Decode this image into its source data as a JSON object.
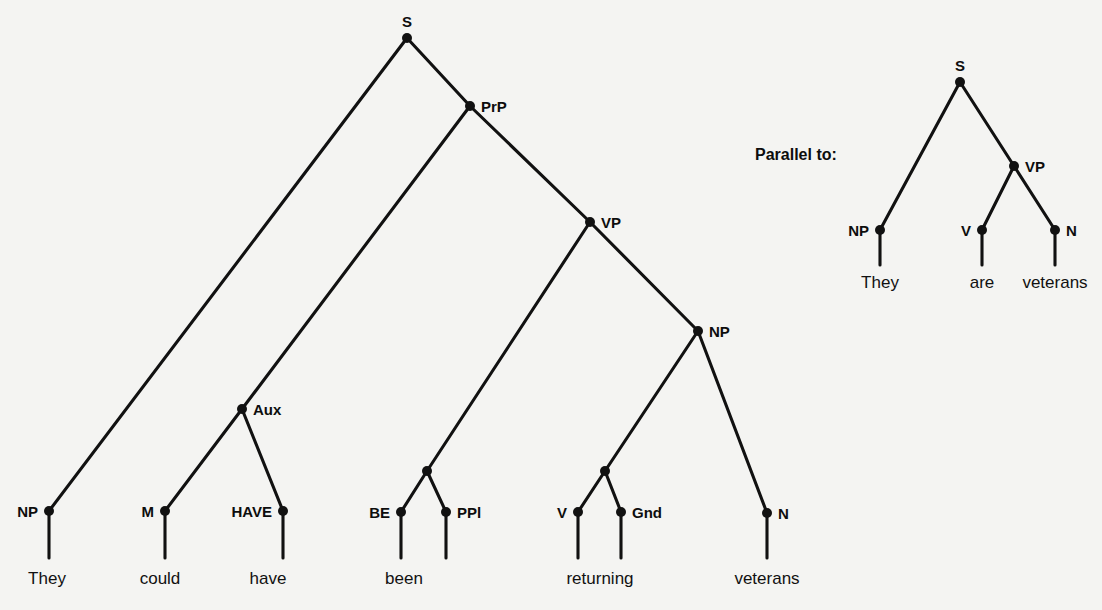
{
  "canvas": {
    "width": 1102,
    "height": 610,
    "background": "#f4f4f2",
    "ink": "#111111"
  },
  "annotation": {
    "parallel_caption": "Parallel to:"
  },
  "diagram": {
    "type": "syntax-tree",
    "sentence_main": "They could have been returning veterans",
    "sentence_parallel": "They are veterans"
  },
  "main_tree": {
    "name": "main-syntax-tree",
    "nodes": [
      {
        "id": "S",
        "label": "S",
        "x": 407,
        "y": 38,
        "anchor": "above"
      },
      {
        "id": "PrP",
        "label": "PrP",
        "x": 470,
        "y": 106,
        "anchor": "right"
      },
      {
        "id": "VP",
        "label": "VP",
        "x": 590,
        "y": 222,
        "anchor": "right"
      },
      {
        "id": "NPobj",
        "label": "NP",
        "x": 698,
        "y": 331,
        "anchor": "right"
      },
      {
        "id": "Aux",
        "label": "Aux",
        "x": 242,
        "y": 409,
        "anchor": "right"
      },
      {
        "id": "BEP",
        "label": "",
        "x": 427,
        "y": 471,
        "anchor": "none"
      },
      {
        "id": "VGP",
        "label": "",
        "x": 605,
        "y": 471,
        "anchor": "none"
      },
      {
        "id": "NPsub",
        "label": "NP",
        "x": 49,
        "y": 511,
        "anchor": "left"
      },
      {
        "id": "M",
        "label": "M",
        "x": 165,
        "y": 511,
        "anchor": "left"
      },
      {
        "id": "HAVE",
        "label": "HAVE",
        "x": 283,
        "y": 511,
        "anchor": "left"
      },
      {
        "id": "BE",
        "label": "BE",
        "x": 401,
        "y": 512,
        "anchor": "left"
      },
      {
        "id": "PPl",
        "label": "PPl",
        "x": 446,
        "y": 512,
        "anchor": "right"
      },
      {
        "id": "V",
        "label": "V",
        "x": 578,
        "y": 512,
        "anchor": "left"
      },
      {
        "id": "Gnd",
        "label": "Gnd",
        "x": 621,
        "y": 512,
        "anchor": "right"
      },
      {
        "id": "N",
        "label": "N",
        "x": 767,
        "y": 513,
        "anchor": "right"
      }
    ],
    "edges": [
      [
        "S",
        "NPsub"
      ],
      [
        "S",
        "PrP"
      ],
      [
        "PrP",
        "Aux"
      ],
      [
        "PrP",
        "VP"
      ],
      [
        "Aux",
        "M"
      ],
      [
        "Aux",
        "HAVE"
      ],
      [
        "VP",
        "BEP"
      ],
      [
        "VP",
        "NPobj"
      ],
      [
        "BEP",
        "BE"
      ],
      [
        "BEP",
        "PPl"
      ],
      [
        "NPobj",
        "VGP"
      ],
      [
        "NPobj",
        "N"
      ],
      [
        "VGP",
        "V"
      ],
      [
        "VGP",
        "Gnd"
      ]
    ],
    "terminals": [
      {
        "parent": "NPsub",
        "word": "They",
        "x": 47,
        "y": 583,
        "stem_top": 511,
        "stem_bottom": 558
      },
      {
        "parent": "M",
        "word": "could",
        "x": 160,
        "y": 583,
        "stem_top": 511,
        "stem_bottom": 558
      },
      {
        "parent": "HAVE",
        "word": "have",
        "x": 268,
        "y": 583,
        "stem_top": 511,
        "stem_bottom": 558
      },
      {
        "parent": "BE",
        "word": "been",
        "x": 404,
        "y": 583,
        "stem_top": 512,
        "stem_bottom": 558
      },
      {
        "parent": "PPl",
        "word": "",
        "x": 446,
        "y": 583,
        "stem_top": 512,
        "stem_bottom": 558
      },
      {
        "parent": "V",
        "word": "returning",
        "x": 600,
        "y": 583,
        "stem_top": 512,
        "stem_bottom": 558
      },
      {
        "parent": "Gnd",
        "word": "",
        "x": 621,
        "y": 583,
        "stem_top": 512,
        "stem_bottom": 558
      },
      {
        "parent": "N",
        "word": "veterans",
        "x": 767,
        "y": 583,
        "stem_top": 513,
        "stem_bottom": 558
      }
    ]
  },
  "parallel_tree": {
    "name": "parallel-syntax-tree",
    "nodes": [
      {
        "id": "S2",
        "label": "S",
        "x": 960,
        "y": 82,
        "anchor": "above"
      },
      {
        "id": "VP2",
        "label": "VP",
        "x": 1014,
        "y": 166,
        "anchor": "right"
      },
      {
        "id": "NP2",
        "label": "NP",
        "x": 880,
        "y": 230,
        "anchor": "left"
      },
      {
        "id": "V2",
        "label": "V",
        "x": 982,
        "y": 230,
        "anchor": "left"
      },
      {
        "id": "N2",
        "label": "N",
        "x": 1055,
        "y": 230,
        "anchor": "right"
      }
    ],
    "edges": [
      [
        "S2",
        "NP2"
      ],
      [
        "S2",
        "VP2"
      ],
      [
        "VP2",
        "V2"
      ],
      [
        "VP2",
        "N2"
      ]
    ],
    "terminals": [
      {
        "parent": "NP2",
        "word": "They",
        "x": 880,
        "y": 287,
        "stem_top": 230,
        "stem_bottom": 265
      },
      {
        "parent": "V2",
        "word": "are",
        "x": 982,
        "y": 287,
        "stem_top": 230,
        "stem_bottom": 265
      },
      {
        "parent": "N2",
        "word": "veterans",
        "x": 1055,
        "y": 287,
        "stem_top": 230,
        "stem_bottom": 265
      }
    ]
  },
  "caption_pos": {
    "x": 755,
    "y": 160
  }
}
